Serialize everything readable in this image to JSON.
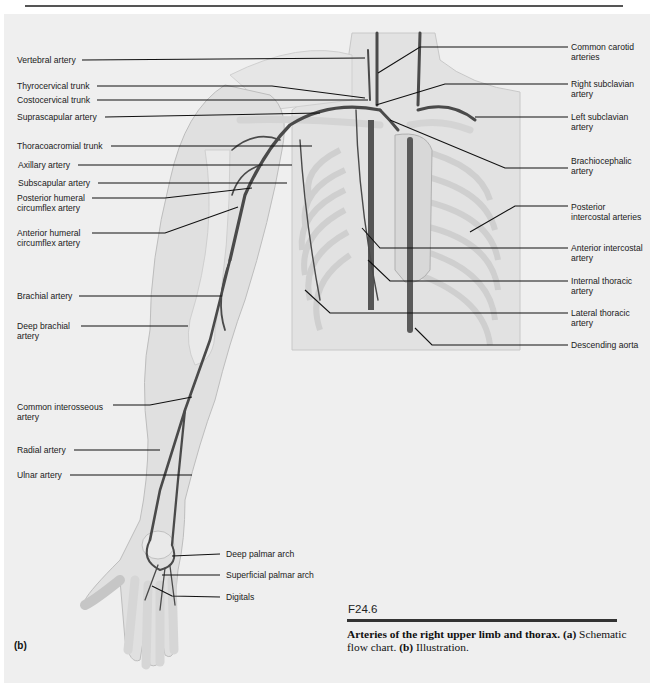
{
  "figure": {
    "number": "F24.6",
    "panel_label": "(b)",
    "caption": {
      "title_bold": "Arteries of the right upper limb and thorax.",
      "part_a_label": "(a)",
      "part_a_text": "Schematic flow chart.",
      "part_b_label": "(b)",
      "part_b_text": "Illustration."
    }
  },
  "labels": {
    "left": [
      {
        "text": "Vertebral artery"
      },
      {
        "text": "Thyrocervical trunk"
      },
      {
        "text": "Costocervical trunk"
      },
      {
        "text": "Suprascapular artery"
      },
      {
        "text": "Thoracoacromial trunk"
      },
      {
        "text": "Axillary artery"
      },
      {
        "text": "Subscapular artery"
      },
      {
        "text": "Posterior humeral\ncircumflex artery"
      },
      {
        "text": "Anterior humeral\ncircumflex artery"
      },
      {
        "text": "Brachial artery"
      },
      {
        "text": "Deep brachial\nartery"
      },
      {
        "text": "Common interosseous\nartery"
      },
      {
        "text": "Radial artery"
      },
      {
        "text": "Ulnar artery"
      }
    ],
    "right": [
      {
        "text": "Common carotid\narteries"
      },
      {
        "text": "Right subclavian\nartery"
      },
      {
        "text": "Left subclavian\nartery"
      },
      {
        "text": "Brachiocephalic\nartery"
      },
      {
        "text": "Posterior\nintercostal arteries"
      },
      {
        "text": "Anterior intercostal\nartery"
      },
      {
        "text": "Internal thoracic\nartery"
      },
      {
        "text": "Lateral thoracic\nartery"
      },
      {
        "text": "Descending aorta"
      }
    ],
    "hand": [
      {
        "text": "Deep palmar arch"
      },
      {
        "text": "Superficial palmar arch"
      },
      {
        "text": "Digitals"
      }
    ]
  },
  "colors": {
    "background": "#efefef",
    "artery": "#4a4a4a",
    "leader_line": "#111111",
    "skin": "#dcdcdc",
    "bone": "#e6e6e6"
  }
}
